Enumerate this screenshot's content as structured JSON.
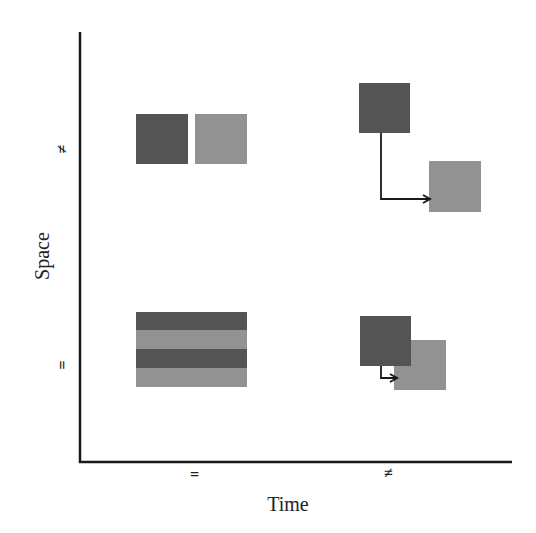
{
  "axes": {
    "x_label": "Time",
    "y_label": "Space",
    "x_ticks": [
      "=",
      "≠"
    ],
    "y_ticks": [
      "≠",
      "="
    ]
  },
  "colors": {
    "dark_block": "#545454",
    "light_block": "#929292",
    "axis": "#1a1a1a",
    "arrow": "#1a1a1a"
  },
  "quadrants": [
    {
      "time": "=",
      "space": "≠",
      "description": "Two blocks side by side at the same time, different locations"
    },
    {
      "time": "≠",
      "space": "≠",
      "description": "Dark block moves to a different location at a later time (arrow)"
    },
    {
      "time": "=",
      "space": "=",
      "description": "Interleaved dark/light stripes at same time and same location"
    },
    {
      "time": "≠",
      "space": "=",
      "description": "Overlapping blocks, small time shift at the same location (arrow)"
    }
  ]
}
